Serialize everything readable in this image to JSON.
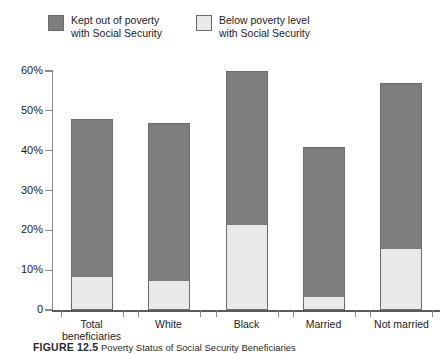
{
  "legend": {
    "entries": [
      {
        "label": "Kept out of poverty\nwith Social Security",
        "swatch_color": "#7d7d7d",
        "key": "kept_out"
      },
      {
        "label": "Below poverty level\nwith Social Security",
        "swatch_color": "#e9e9e9",
        "key": "below"
      }
    ]
  },
  "axis": {
    "y_tick_labels": [
      "60%",
      "50%",
      "40%",
      "30%",
      "20%",
      "10%",
      "0"
    ],
    "y_tick_values": [
      60,
      50,
      40,
      30,
      20,
      10,
      0
    ]
  },
  "x_labels": {
    "total": "Total\nbeneficiaries",
    "white": "White",
    "black": "Black",
    "married": "Married",
    "not_married": "Not married"
  },
  "caption": {
    "figure_label": "FIGURE 12.5",
    "figure_text": "Poverty Status of Social Security Beneficiaries"
  },
  "chart_data": {
    "type": "bar",
    "subtype": "stacked",
    "title": "",
    "xlabel": "",
    "ylabel": "",
    "ylim": [
      0,
      60
    ],
    "yticks": [
      0,
      10,
      20,
      30,
      40,
      50,
      60
    ],
    "ytick_labels": [
      "0",
      "10%",
      "20%",
      "30%",
      "40%",
      "50%",
      "60%"
    ],
    "grid": false,
    "legend_position": "top",
    "categories": [
      "Total beneficiaries",
      "White",
      "Black",
      "Married",
      "Not married"
    ],
    "series": [
      {
        "name": "Below poverty level with Social Security",
        "color": "#e9e9e9",
        "values": [
          8,
          7,
          21,
          3,
          15
        ]
      },
      {
        "name": "Kept out of poverty with Social Security",
        "color": "#7d7d7d",
        "values": [
          40,
          40,
          39,
          38,
          42
        ]
      }
    ],
    "totals": [
      48,
      47,
      60,
      41,
      57
    ]
  }
}
